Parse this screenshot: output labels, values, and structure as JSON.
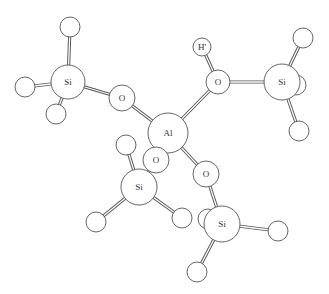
{
  "atoms": [
    {
      "id": "H_si1_top",
      "label": "",
      "x": 70,
      "y": 27,
      "r": 10
    },
    {
      "id": "H_si1_left",
      "label": "",
      "x": 25,
      "y": 87,
      "r": 10
    },
    {
      "id": "H_si1_bot",
      "label": "",
      "x": 56,
      "y": 114,
      "r": 10
    },
    {
      "id": "Si1",
      "label": "Si",
      "x": 68,
      "y": 82,
      "r": 17
    },
    {
      "id": "O1",
      "label": "O",
      "x": 122,
      "y": 98,
      "r": 13
    },
    {
      "id": "Hprime",
      "label": "H'",
      "x": 202,
      "y": 47,
      "r": 9
    },
    {
      "id": "H_si2_back",
      "label": "",
      "x": 296,
      "y": 85,
      "r": 10
    },
    {
      "id": "H_si2_top",
      "label": "",
      "x": 303,
      "y": 38,
      "r": 10
    },
    {
      "id": "H_si2_bot",
      "label": "",
      "x": 299,
      "y": 131,
      "r": 10
    },
    {
      "id": "O2",
      "label": "O",
      "x": 218,
      "y": 82,
      "r": 12
    },
    {
      "id": "Si2",
      "label": "Si",
      "x": 282,
      "y": 82,
      "r": 18
    },
    {
      "id": "Al",
      "label": "Al",
      "x": 168,
      "y": 133,
      "r": 20
    },
    {
      "id": "H_si3_top",
      "label": "",
      "x": 126,
      "y": 145,
      "r": 10
    },
    {
      "id": "H_si3_left",
      "label": "",
      "x": 96,
      "y": 222,
      "r": 10
    },
    {
      "id": "H_si3_right",
      "label": "",
      "x": 182,
      "y": 218,
      "r": 10
    },
    {
      "id": "O3",
      "label": "O",
      "x": 156,
      "y": 160,
      "r": 13
    },
    {
      "id": "Si3",
      "label": "Si",
      "x": 139,
      "y": 187,
      "r": 18
    },
    {
      "id": "H_si4_back",
      "label": "",
      "x": 208,
      "y": 219,
      "r": 10
    },
    {
      "id": "O4",
      "label": "O",
      "x": 206,
      "y": 174,
      "r": 13
    },
    {
      "id": "H_si4_right",
      "label": "",
      "x": 278,
      "y": 231,
      "r": 10
    },
    {
      "id": "H_si4_bot",
      "label": "",
      "x": 197,
      "y": 272,
      "r": 10
    },
    {
      "id": "Si4",
      "label": "Si",
      "x": 222,
      "y": 224,
      "r": 18
    }
  ],
  "bonds": [
    [
      "Si1",
      "H_si1_top"
    ],
    [
      "Si1",
      "H_si1_left"
    ],
    [
      "Si1",
      "H_si1_bot"
    ],
    [
      "Si1",
      "O1"
    ],
    [
      "O1",
      "Al"
    ],
    [
      "O2",
      "Hprime"
    ],
    [
      "O2",
      "Si2"
    ],
    [
      "O2",
      "Al"
    ],
    [
      "Si2",
      "H_si2_top"
    ],
    [
      "Si2",
      "H_si2_bot"
    ],
    [
      "Si2",
      "H_si2_back"
    ],
    [
      "Al",
      "O3"
    ],
    [
      "O3",
      "Si3"
    ],
    [
      "Si3",
      "H_si3_top"
    ],
    [
      "Si3",
      "H_si3_left"
    ],
    [
      "Si3",
      "H_si3_right"
    ],
    [
      "Al",
      "O4"
    ],
    [
      "O4",
      "Si4"
    ],
    [
      "Si4",
      "H_si4_back"
    ],
    [
      "Si4",
      "H_si4_right"
    ],
    [
      "Si4",
      "H_si4_bot"
    ]
  ],
  "colors": {
    "stroke": "#555555",
    "fill": "#ffffff",
    "text": "#333333"
  }
}
